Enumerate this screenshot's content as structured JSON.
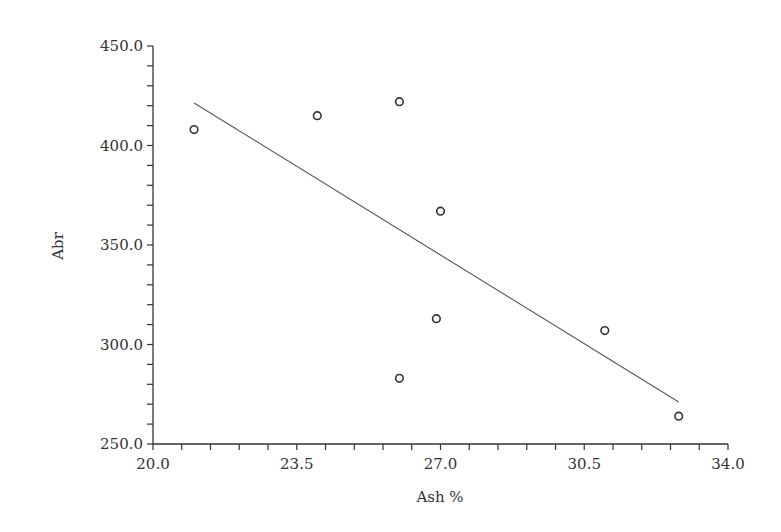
{
  "chart_data": {
    "type": "scatter",
    "title": "",
    "xlabel": "Ash %",
    "ylabel": "Abr",
    "xlim": [
      20.0,
      34.0
    ],
    "ylim": [
      250.0,
      450.0
    ],
    "x_ticks": [
      "20.0",
      "23.5",
      "27.0",
      "30.5",
      "34.0"
    ],
    "x_tick_values": [
      20.0,
      23.5,
      27.0,
      30.5,
      34.0
    ],
    "x_minor_step": 0.7,
    "y_ticks": [
      "250.0",
      "300.0",
      "350.0",
      "400.0",
      "450.0"
    ],
    "y_tick_values": [
      250.0,
      300.0,
      350.0,
      400.0,
      450.0
    ],
    "y_minor_step": 10,
    "grid": false,
    "legend": null,
    "series": [
      {
        "name": "observations",
        "marker": "open-circle",
        "points": [
          {
            "x": 21.0,
            "y": 408
          },
          {
            "x": 24.0,
            "y": 415
          },
          {
            "x": 26.0,
            "y": 422
          },
          {
            "x": 27.0,
            "y": 367
          },
          {
            "x": 26.9,
            "y": 313
          },
          {
            "x": 26.0,
            "y": 283
          },
          {
            "x": 31.0,
            "y": 307
          },
          {
            "x": 32.8,
            "y": 264
          }
        ]
      },
      {
        "name": "linear-fit",
        "type": "line",
        "points": [
          {
            "x": 21.0,
            "y": 421.4
          },
          {
            "x": 32.8,
            "y": 271.1
          }
        ]
      }
    ]
  },
  "colors": {
    "axis": "#333333",
    "marker": "#333333",
    "fit_line": "#555555",
    "background": "#ffffff"
  }
}
